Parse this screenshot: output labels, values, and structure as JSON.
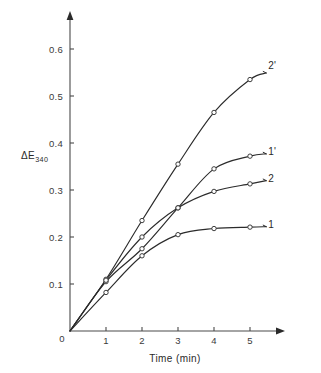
{
  "chart_data": {
    "type": "line",
    "title": "",
    "subtitle": "",
    "xlabel": "Time (min)",
    "ylabel": "ΔE",
    "ylabel_subscript": "340",
    "xlim": [
      0,
      5.6
    ],
    "ylim": [
      0,
      0.65
    ],
    "grid": false,
    "legend_position": "right-of-curve-ends",
    "x_ticks": [
      "1",
      "2",
      "3",
      "4",
      "5"
    ],
    "x_tick_values": [
      1,
      2,
      3,
      4,
      5
    ],
    "y_ticks": [
      "0.1",
      "0.2",
      "0.3",
      "0.4",
      "0.5",
      "0.6"
    ],
    "y_tick_values": [
      0.1,
      0.2,
      0.3,
      0.4,
      0.5,
      0.6
    ],
    "origin_label": "0",
    "marker_style": "open-circle",
    "x": [
      0,
      1,
      2,
      3,
      4,
      5
    ],
    "series": [
      {
        "name": "2'",
        "label": "2'",
        "values": [
          0,
          0.11,
          0.235,
          0.355,
          0.465,
          0.535
        ],
        "plateau_value": 0.549,
        "label_x": 5.45,
        "label_y": 0.565
      },
      {
        "name": "1'",
        "label": "1'",
        "values": [
          0,
          0.105,
          0.175,
          0.262,
          0.345,
          0.372
        ],
        "plateau_value": 0.377,
        "label_x": 5.45,
        "label_y": 0.383
      },
      {
        "name": "2",
        "label": "2",
        "values": [
          0,
          0.108,
          0.2,
          0.262,
          0.297,
          0.313
        ],
        "plateau_value": 0.32,
        "label_x": 5.45,
        "label_y": 0.326
      },
      {
        "name": "1",
        "label": "1",
        "values": [
          0,
          0.082,
          0.16,
          0.205,
          0.218,
          0.221
        ],
        "plateau_value": 0.222,
        "label_x": 5.45,
        "label_y": 0.228
      }
    ]
  },
  "colors": {
    "background": "#ffffff",
    "ink": "#2b2b2b",
    "axis": "#4a4a4a",
    "marker_fill": "#ffffff"
  }
}
